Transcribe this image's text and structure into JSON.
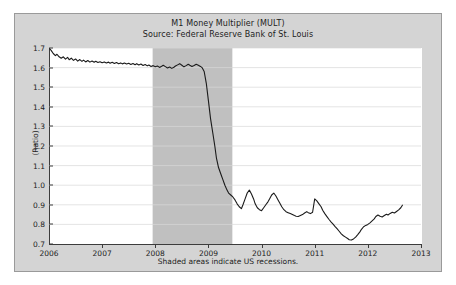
{
  "chart_data": {
    "type": "line",
    "title": "M1 Money Multiplier (MULT)",
    "subtitle": "Source: Federal Reserve Bank of St. Louis",
    "xlabel": "",
    "ylabel": "(Ratio)",
    "footnote": "Shaded areas indicate US recessions.",
    "xlim": [
      2006.0,
      2013.0
    ],
    "ylim": [
      0.7,
      1.7
    ],
    "grid": true,
    "legend": "none",
    "line_color": "#1a1a1a",
    "plot_background": "#ffffff",
    "figure_background": "#d4d4d4",
    "recession_band_color": "#c0c0c0",
    "xticks": [
      "2006",
      "2007",
      "2008",
      "2009",
      "2010",
      "2011",
      "2012",
      "2013"
    ],
    "xtick_values": [
      2006,
      2007,
      2008,
      2009,
      2010,
      2011,
      2012,
      2013
    ],
    "yticks": [
      "0.7",
      "0.8",
      "0.9",
      "1.0",
      "1.1",
      "1.2",
      "1.3",
      "1.4",
      "1.5",
      "1.6",
      "1.7"
    ],
    "ytick_values": [
      0.7,
      0.8,
      0.9,
      1.0,
      1.1,
      1.2,
      1.3,
      1.4,
      1.5,
      1.6,
      1.7
    ],
    "recessions": [
      {
        "start": 2007.95,
        "end": 2009.45
      }
    ],
    "series": [
      {
        "name": "M1 Money Multiplier (MULT)",
        "x": [
          2006.0,
          2006.04,
          2006.08,
          2006.12,
          2006.15,
          2006.19,
          2006.23,
          2006.27,
          2006.31,
          2006.35,
          2006.38,
          2006.42,
          2006.46,
          2006.5,
          2006.54,
          2006.58,
          2006.62,
          2006.65,
          2006.69,
          2006.73,
          2006.77,
          2006.81,
          2006.85,
          2006.88,
          2006.92,
          2006.96,
          2007.0,
          2007.04,
          2007.08,
          2007.12,
          2007.15,
          2007.19,
          2007.23,
          2007.27,
          2007.31,
          2007.35,
          2007.38,
          2007.42,
          2007.46,
          2007.5,
          2007.54,
          2007.58,
          2007.62,
          2007.65,
          2007.69,
          2007.73,
          2007.77,
          2007.81,
          2007.85,
          2007.88,
          2007.92,
          2007.96,
          2008.0,
          2008.04,
          2008.08,
          2008.12,
          2008.15,
          2008.19,
          2008.23,
          2008.27,
          2008.31,
          2008.35,
          2008.38,
          2008.42,
          2008.46,
          2008.5,
          2008.54,
          2008.58,
          2008.62,
          2008.65,
          2008.69,
          2008.73,
          2008.77,
          2008.81,
          2008.85,
          2008.88,
          2008.92,
          2008.96,
          2009.0,
          2009.04,
          2009.08,
          2009.12,
          2009.15,
          2009.19,
          2009.23,
          2009.27,
          2009.31,
          2009.35,
          2009.38,
          2009.42,
          2009.46,
          2009.5,
          2009.54,
          2009.58,
          2009.62,
          2009.65,
          2009.69,
          2009.73,
          2009.77,
          2009.81,
          2009.85,
          2009.88,
          2009.92,
          2009.96,
          2010.0,
          2010.04,
          2010.08,
          2010.12,
          2010.15,
          2010.19,
          2010.23,
          2010.27,
          2010.31,
          2010.35,
          2010.38,
          2010.42,
          2010.46,
          2010.5,
          2010.54,
          2010.58,
          2010.62,
          2010.65,
          2010.69,
          2010.73,
          2010.77,
          2010.81,
          2010.85,
          2010.88,
          2010.92,
          2010.96,
          2011.0,
          2011.04,
          2011.08,
          2011.12,
          2011.15,
          2011.19,
          2011.23,
          2011.27,
          2011.31,
          2011.35,
          2011.38,
          2011.42,
          2011.46,
          2011.5,
          2011.54,
          2011.58,
          2011.62,
          2011.65,
          2011.69,
          2011.73,
          2011.77,
          2011.81,
          2011.85,
          2011.88,
          2011.92,
          2011.96,
          2012.0,
          2012.04,
          2012.08,
          2012.12,
          2012.15,
          2012.19,
          2012.23,
          2012.27,
          2012.31,
          2012.35,
          2012.38,
          2012.42,
          2012.46,
          2012.5,
          2012.54,
          2012.58,
          2012.62,
          2012.65
        ],
        "y": [
          1.7,
          1.688,
          1.672,
          1.661,
          1.668,
          1.655,
          1.648,
          1.655,
          1.643,
          1.652,
          1.64,
          1.648,
          1.637,
          1.644,
          1.633,
          1.641,
          1.632,
          1.638,
          1.629,
          1.636,
          1.628,
          1.634,
          1.627,
          1.632,
          1.626,
          1.63,
          1.625,
          1.629,
          1.624,
          1.628,
          1.622,
          1.627,
          1.621,
          1.626,
          1.62,
          1.624,
          1.619,
          1.623,
          1.618,
          1.622,
          1.616,
          1.621,
          1.615,
          1.62,
          1.613,
          1.618,
          1.611,
          1.616,
          1.609,
          1.613,
          1.606,
          1.61,
          1.604,
          1.608,
          1.601,
          1.607,
          1.612,
          1.605,
          1.598,
          1.603,
          1.596,
          1.602,
          1.608,
          1.614,
          1.62,
          1.612,
          1.604,
          1.61,
          1.617,
          1.612,
          1.606,
          1.611,
          1.617,
          1.612,
          1.606,
          1.6,
          1.58,
          1.52,
          1.43,
          1.34,
          1.27,
          1.2,
          1.14,
          1.09,
          1.06,
          1.03,
          1.0,
          0.975,
          0.96,
          0.95,
          0.94,
          0.925,
          0.905,
          0.89,
          0.88,
          0.9,
          0.93,
          0.96,
          0.975,
          0.955,
          0.93,
          0.905,
          0.885,
          0.875,
          0.87,
          0.885,
          0.9,
          0.915,
          0.93,
          0.95,
          0.96,
          0.945,
          0.925,
          0.905,
          0.89,
          0.875,
          0.865,
          0.86,
          0.855,
          0.85,
          0.845,
          0.842,
          0.84,
          0.845,
          0.85,
          0.858,
          0.865,
          0.86,
          0.855,
          0.862,
          0.87,
          0.865,
          0.86,
          0.868,
          0.875,
          0.87,
          0.878,
          0.885,
          0.88,
          0.875,
          0.882,
          0.876,
          0.87,
          0.865,
          0.872,
          0.88,
          0.888,
          0.882,
          0.875,
          0.885,
          0.895,
          0.89,
          0.882,
          0.89,
          0.898,
          0.905,
          0.898,
          0.888,
          0.905,
          0.9,
          0.89,
          0.88,
          0.895,
          0.905,
          0.9,
          0.895,
          0.888,
          0.88,
          0.87,
          0.862,
          0.855,
          0.848,
          0.842,
          0.838
        ]
      }
    ],
    "series_tail": {
      "note": "continuation of the single series through mid-2012",
      "x": [
        2011.0,
        2011.04,
        2011.08,
        2011.12,
        2011.15,
        2011.19,
        2011.23,
        2011.27,
        2011.31,
        2011.35,
        2011.38,
        2011.42,
        2011.46,
        2011.5,
        2011.54,
        2011.58,
        2011.62,
        2011.65,
        2011.69,
        2011.73,
        2011.77,
        2011.81,
        2011.85,
        2011.88,
        2011.92,
        2011.96,
        2012.0,
        2012.04,
        2012.08,
        2012.12,
        2012.15,
        2012.19,
        2012.23,
        2012.27,
        2012.31,
        2012.35,
        2012.38,
        2012.42,
        2012.46,
        2012.5,
        2012.54,
        2012.58,
        2012.62,
        2012.65
      ],
      "y": [
        0.93,
        0.92,
        0.905,
        0.89,
        0.872,
        0.855,
        0.84,
        0.825,
        0.812,
        0.8,
        0.79,
        0.778,
        0.765,
        0.752,
        0.742,
        0.735,
        0.728,
        0.722,
        0.72,
        0.726,
        0.735,
        0.748,
        0.762,
        0.775,
        0.788,
        0.795,
        0.8,
        0.808,
        0.818,
        0.828,
        0.84,
        0.848,
        0.842,
        0.838,
        0.845,
        0.852,
        0.848,
        0.856,
        0.862,
        0.858,
        0.866,
        0.874,
        0.885,
        0.898
      ]
    }
  }
}
